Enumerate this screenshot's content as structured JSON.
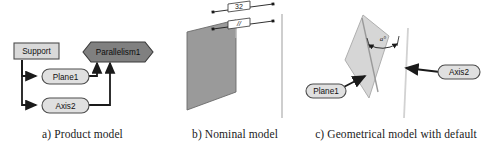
{
  "figure": {
    "width": 487,
    "height": 146,
    "background": "#ffffff"
  },
  "panels": [
    {
      "id": "product-model",
      "caption": "a) Product model",
      "nodes": [
        {
          "id": "support",
          "label": "Support",
          "shape": "rectangle",
          "fill": "#d9d9d9",
          "stroke": "#4d4d4d"
        },
        {
          "id": "plane1",
          "label": "Plane1",
          "shape": "stadium",
          "fill": "#e0e0e0",
          "stroke": "#4d4d4d"
        },
        {
          "id": "axis2",
          "label": "Axis2",
          "shape": "stadium",
          "fill": "#e0e0e0",
          "stroke": "#4d4d4d"
        },
        {
          "id": "parallelism1",
          "label": "Parallelism1",
          "shape": "hexagon",
          "fill": "#808080",
          "stroke": "#3a3a3a"
        }
      ],
      "edges": [
        {
          "from": "support",
          "to": "plane1"
        },
        {
          "from": "support",
          "to": "axis2"
        },
        {
          "from": "plane1",
          "to": "parallelism1"
        },
        {
          "from": "axis2",
          "to": "parallelism1"
        }
      ]
    },
    {
      "id": "nominal-model",
      "caption": "b) Nominal model",
      "plane_fill": "#9a9a9a",
      "plane_stroke": "#555555",
      "dimensions": [
        {
          "id": "distance",
          "label": "32",
          "boxed": true
        },
        {
          "id": "parallelism-tolerance",
          "label": "//",
          "boxed": true,
          "icon": "parallelism-symbol"
        }
      ],
      "axis_color": "#bdbdbd"
    },
    {
      "id": "geometrical-model",
      "caption": "c) Geometrical model with default",
      "plane_fill": "#d6d6d6",
      "plane_stroke": "#8c8c8c",
      "axis_color": "#cfcfcf",
      "angle_label": "a°",
      "nodes": [
        {
          "id": "plane1",
          "label": "Plane1",
          "shape": "stadium",
          "fill": "#e0e0e0",
          "stroke": "#4d4d4d"
        },
        {
          "id": "axis2",
          "label": "Axis2",
          "shape": "stadium",
          "fill": "#e0e0e0",
          "stroke": "#4d4d4d"
        }
      ],
      "callouts": [
        {
          "from": "plane1",
          "to": "plane-surface"
        },
        {
          "from": "axis2",
          "to": "axis-line"
        }
      ]
    }
  ]
}
